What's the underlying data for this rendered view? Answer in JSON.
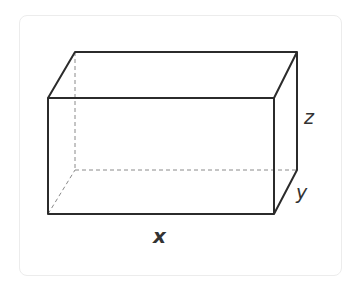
{
  "diagram": {
    "labels": {
      "width": "x",
      "depth": "y",
      "height": "z"
    },
    "colors": {
      "edge": "#2b2b2b",
      "hidden_edge": "#8a8a8a",
      "label": "#333333",
      "card_border": "#ececec"
    },
    "vertices": {
      "front_top_left": [
        48,
        98
      ],
      "front_top_right": [
        274,
        98
      ],
      "front_bottom_left": [
        48,
        214
      ],
      "front_bottom_right": [
        274,
        214
      ],
      "back_top_left": [
        75,
        52
      ],
      "back_top_right": [
        297,
        52
      ],
      "back_bottom_left": [
        75,
        170
      ],
      "back_bottom_right": [
        297,
        170
      ]
    }
  }
}
